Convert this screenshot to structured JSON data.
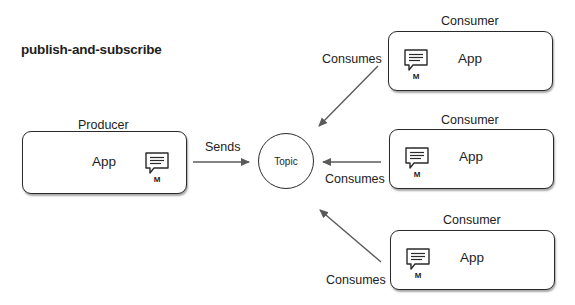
{
  "title": "publish-and-subscribe",
  "producer": {
    "label": "Producer",
    "app_label": "App",
    "message_icon": "message-icon",
    "message_label": "M"
  },
  "sends_label": "Sends",
  "topic": {
    "label": "Topic"
  },
  "consumers": [
    {
      "label": "Consumer",
      "app_label": "App",
      "message_icon": "message-icon",
      "message_label": "M",
      "edge_label": "Consumes"
    },
    {
      "label": "Consumer",
      "app_label": "App",
      "message_icon": "message-icon",
      "message_label": "M",
      "edge_label": "Consumes"
    },
    {
      "label": "Consumer",
      "app_label": "App",
      "message_icon": "message-icon",
      "message_label": "M",
      "edge_label": "Consumes"
    }
  ],
  "colors": {
    "stroke": "#2a2a2a",
    "arrow": "#5a5a5a",
    "background": "#ffffff"
  }
}
